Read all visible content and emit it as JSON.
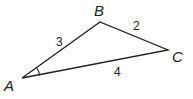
{
  "diagram": {
    "type": "triangle",
    "vertices": [
      {
        "name": "A",
        "x": 22,
        "y": 78
      },
      {
        "name": "B",
        "x": 100,
        "y": 22
      },
      {
        "name": "C",
        "x": 168,
        "y": 50
      }
    ],
    "sides": [
      {
        "between": "AB",
        "length_label": "3"
      },
      {
        "between": "BC",
        "length_label": "2"
      },
      {
        "between": "AC",
        "length_label": "4"
      }
    ],
    "marked_angle": "A",
    "colors": {
      "stroke": "#222222",
      "background": "#ffffff"
    }
  }
}
